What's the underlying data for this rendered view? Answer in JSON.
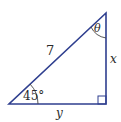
{
  "diagram": {
    "type": "right-triangle",
    "line_color": "#2f3f8f",
    "labels": {
      "hypotenuse": "7",
      "angle_top": "θ",
      "angle_bottom_left": "45°",
      "side_vertical": "x",
      "side_horizontal": "y"
    },
    "right_angle_marker": "bottom-right"
  }
}
